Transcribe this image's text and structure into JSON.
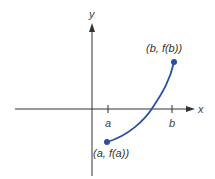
{
  "diagram": {
    "axes": {
      "x_label": "x",
      "y_label": "y",
      "color": "#333333"
    },
    "ticks": [
      {
        "label": "a"
      },
      {
        "label": "b"
      }
    ],
    "curve": {
      "color": "#2a4fa0",
      "description": "increasing, concave-up curve from (a, f(a)) below the x-axis to (b, f(b)) above the x-axis"
    },
    "points": [
      {
        "label": "(a, f(a))"
      },
      {
        "label": "(b, f(b))"
      }
    ]
  }
}
